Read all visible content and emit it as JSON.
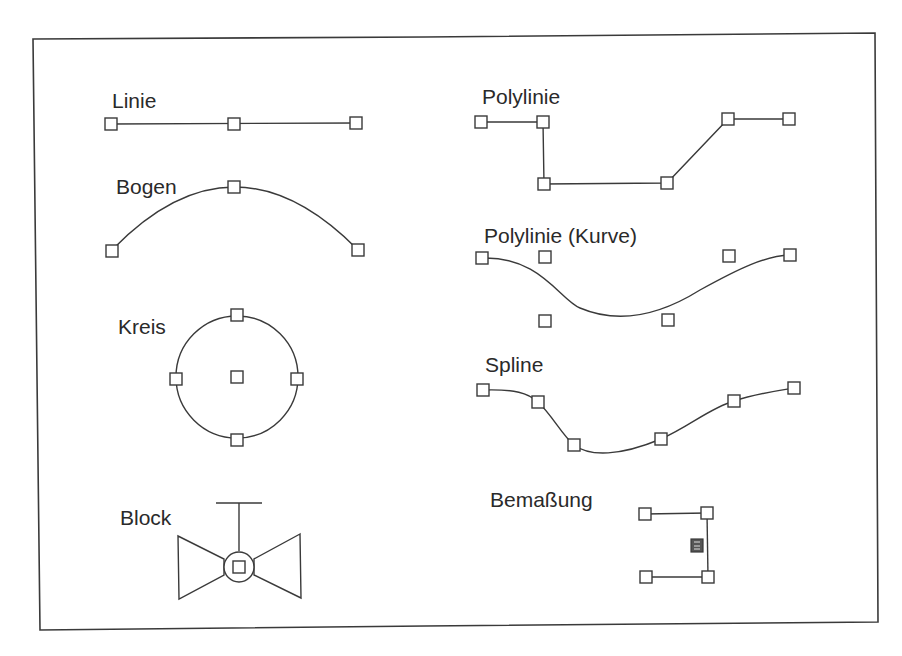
{
  "figure": {
    "labels": {
      "linie": "Linie",
      "bogen": "Bogen",
      "kreis": "Kreis",
      "block": "Block",
      "polylinie": "Polylinie",
      "polylinie_kurve": "Polylinie (Kurve)",
      "spline": "Spline",
      "bemassung": "Bemaßung"
    },
    "colors": {
      "line": "#3a3a3a",
      "text": "#2a2a2a",
      "background": "#ffffff"
    },
    "entities": [
      {
        "name": "Linie",
        "grips": [
          [
            111,
            124
          ],
          [
            234,
            124
          ],
          [
            356,
            123
          ]
        ]
      },
      {
        "name": "Bogen",
        "grips": [
          [
            112,
            251
          ],
          [
            234,
            187
          ],
          [
            358,
            250
          ]
        ]
      },
      {
        "name": "Kreis",
        "center": [
          237,
          377
        ],
        "radius": 61,
        "grips": [
          [
            237,
            315
          ],
          [
            176,
            379
          ],
          [
            297,
            379
          ],
          [
            237,
            377
          ],
          [
            237,
            440
          ]
        ]
      },
      {
        "name": "Block",
        "grips": [
          [
            239,
            566
          ]
        ]
      },
      {
        "name": "Polylinie",
        "grips": [
          [
            481,
            122
          ],
          [
            543,
            122
          ],
          [
            544,
            184
          ],
          [
            667,
            183
          ],
          [
            728,
            119
          ],
          [
            789,
            119
          ]
        ]
      },
      {
        "name": "Polylinie (Kurve)",
        "grips": [
          [
            482,
            258
          ],
          [
            545,
            257
          ],
          [
            729,
            256
          ],
          [
            790,
            255
          ],
          [
            545,
            321
          ],
          [
            668,
            320
          ]
        ]
      },
      {
        "name": "Spline",
        "grips": [
          [
            483,
            390
          ],
          [
            538,
            402
          ],
          [
            574,
            445
          ],
          [
            661,
            439
          ],
          [
            734,
            401
          ],
          [
            794,
            388
          ]
        ]
      },
      {
        "name": "Bemaßung",
        "grips": [
          [
            645,
            514
          ],
          [
            707,
            513
          ],
          [
            646,
            577
          ],
          [
            708,
            577
          ],
          [
            697,
            545
          ]
        ]
      }
    ]
  }
}
